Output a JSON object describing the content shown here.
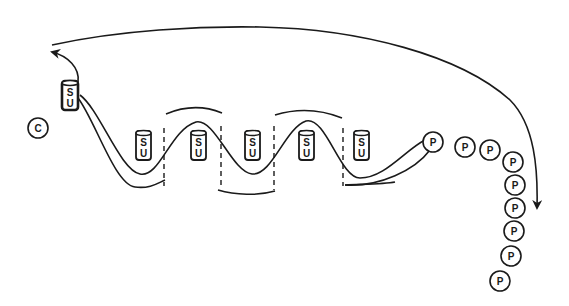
{
  "diagram": {
    "colors": {
      "ink": "#1a1a1a",
      "background": "#ffffff"
    },
    "coach": {
      "label": "C",
      "x": 38,
      "y": 128
    },
    "lead_cylinder": {
      "top": "S",
      "bottom": "U",
      "x": 70,
      "y": 96,
      "emphasized": true
    },
    "cylinders": [
      {
        "top": "S",
        "bottom": "U",
        "x": 143,
        "y": 146
      },
      {
        "top": "S",
        "bottom": "U",
        "x": 198,
        "y": 146
      },
      {
        "top": "S",
        "bottom": "U",
        "x": 252,
        "y": 146
      },
      {
        "top": "S",
        "bottom": "U",
        "x": 306,
        "y": 146
      },
      {
        "top": "S",
        "bottom": "U",
        "x": 361,
        "y": 146
      }
    ],
    "players": [
      {
        "label": "P",
        "x": 433,
        "y": 142
      },
      {
        "label": "P",
        "x": 465,
        "y": 147
      },
      {
        "label": "P",
        "x": 490,
        "y": 150
      },
      {
        "label": "P",
        "x": 513,
        "y": 162
      },
      {
        "label": "P",
        "x": 515,
        "y": 185
      },
      {
        "label": "P",
        "x": 515,
        "y": 208
      },
      {
        "label": "P",
        "x": 514,
        "y": 231
      },
      {
        "label": "P",
        "x": 511,
        "y": 256
      },
      {
        "label": "P",
        "x": 500,
        "y": 281
      }
    ],
    "dashed_gates_x": [
      164,
      221,
      274,
      343
    ],
    "return_arrow": {
      "from": [
        536,
        210
      ],
      "to": [
        50,
        52
      ],
      "description": "large return arc over the drill"
    }
  }
}
